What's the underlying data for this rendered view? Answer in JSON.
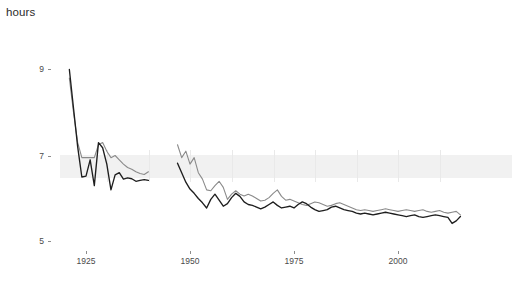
{
  "chart_data": {
    "type": "line",
    "title": "",
    "ylabel": "hours",
    "xlabel": "",
    "ylim": [
      4.55,
      9.55
    ],
    "xlim": [
      1918.5,
      2016.5
    ],
    "grid": "faint vertical gridlines at decade marks plus one faint horizontal band near 6.85",
    "legend": "none",
    "yticks": [
      9,
      7,
      5
    ],
    "ytick_labels": [
      "9",
      "7",
      "5"
    ],
    "xticks": [
      1925,
      1950,
      1975,
      2000
    ],
    "xtick_labels": [
      "1925",
      "1950",
      "1975",
      "2000"
    ],
    "series": [
      {
        "name": "dark-series",
        "color": "#1e1e1e",
        "x": [
          1921,
          1922,
          1923,
          1924,
          1925,
          1926,
          1927,
          1928,
          1929,
          1930,
          1931,
          1932,
          1933,
          1934,
          1935,
          1936,
          1937,
          1938,
          1939,
          1940,
          1947,
          1948,
          1949,
          1950,
          1951,
          1952,
          1953,
          1954,
          1955,
          1956,
          1957,
          1958,
          1959,
          1960,
          1961,
          1962,
          1963,
          1964,
          1965,
          1966,
          1967,
          1968,
          1969,
          1970,
          1971,
          1972,
          1973,
          1974,
          1975,
          1976,
          1977,
          1978,
          1979,
          1980,
          1981,
          1982,
          1983,
          1984,
          1985,
          1986,
          1987,
          1988,
          1989,
          1990,
          1991,
          1992,
          1993,
          1994,
          1995,
          1996,
          1997,
          1998,
          1999,
          2000,
          2001,
          2002,
          2003,
          2004,
          2005,
          2006,
          2007,
          2008,
          2009,
          2010,
          2011,
          2012,
          2013,
          2014,
          2015
        ],
        "values": [
          9.0,
          8.1,
          7.2,
          6.5,
          6.52,
          6.9,
          6.3,
          7.3,
          7.18,
          6.8,
          6.2,
          6.55,
          6.6,
          6.45,
          6.48,
          6.46,
          6.4,
          6.42,
          6.44,
          6.42,
          6.82,
          6.6,
          6.38,
          6.22,
          6.12,
          6.0,
          5.9,
          5.78,
          5.98,
          6.1,
          5.96,
          5.82,
          5.88,
          6.02,
          6.12,
          6.05,
          5.92,
          5.86,
          5.84,
          5.8,
          5.76,
          5.8,
          5.86,
          5.92,
          5.84,
          5.78,
          5.8,
          5.82,
          5.78,
          5.86,
          5.92,
          5.88,
          5.8,
          5.74,
          5.7,
          5.72,
          5.74,
          5.8,
          5.82,
          5.78,
          5.74,
          5.72,
          5.7,
          5.66,
          5.64,
          5.66,
          5.64,
          5.62,
          5.64,
          5.66,
          5.68,
          5.66,
          5.64,
          5.62,
          5.6,
          5.58,
          5.6,
          5.62,
          5.58,
          5.56,
          5.58,
          5.6,
          5.62,
          5.6,
          5.58,
          5.56,
          5.42,
          5.48,
          5.58
        ]
      },
      {
        "name": "gray-series",
        "color": "#8a8a8a",
        "x": [
          1921,
          1922,
          1923,
          1924,
          1925,
          1926,
          1927,
          1928,
          1929,
          1930,
          1931,
          1932,
          1933,
          1934,
          1935,
          1936,
          1937,
          1938,
          1939,
          1940,
          1947,
          1948,
          1949,
          1950,
          1951,
          1952,
          1953,
          1954,
          1955,
          1956,
          1957,
          1958,
          1959,
          1960,
          1961,
          1962,
          1963,
          1964,
          1965,
          1966,
          1967,
          1968,
          1969,
          1970,
          1971,
          1972,
          1973,
          1974,
          1975,
          1976,
          1977,
          1978,
          1979,
          1980,
          1981,
          1982,
          1983,
          1984,
          1985,
          1986,
          1987,
          1988,
          1989,
          1990,
          1991,
          1992,
          1993,
          1994,
          1995,
          1996,
          1997,
          1998,
          1999,
          2000,
          2001,
          2002,
          2003,
          2004,
          2005,
          2006,
          2007,
          2008,
          2009,
          2010,
          2011,
          2012,
          2013,
          2014,
          2015
        ],
        "values": [
          8.8,
          8.0,
          7.3,
          6.95,
          6.95,
          6.95,
          6.95,
          7.25,
          7.3,
          7.1,
          6.95,
          7.0,
          6.9,
          6.8,
          6.72,
          6.68,
          6.62,
          6.58,
          6.56,
          6.62,
          7.25,
          6.95,
          7.1,
          6.8,
          6.95,
          6.6,
          6.45,
          6.2,
          6.18,
          6.3,
          6.4,
          6.26,
          5.98,
          6.1,
          6.18,
          6.1,
          6.06,
          6.1,
          6.06,
          6.0,
          5.94,
          5.96,
          6.02,
          6.12,
          6.2,
          6.05,
          5.96,
          5.98,
          5.94,
          5.9,
          5.86,
          5.84,
          5.88,
          5.92,
          5.9,
          5.86,
          5.82,
          5.84,
          5.88,
          5.9,
          5.86,
          5.82,
          5.78,
          5.74,
          5.72,
          5.74,
          5.72,
          5.7,
          5.72,
          5.74,
          5.76,
          5.74,
          5.72,
          5.7,
          5.72,
          5.74,
          5.72,
          5.7,
          5.72,
          5.74,
          5.7,
          5.68,
          5.7,
          5.72,
          5.68,
          5.66,
          5.68,
          5.7,
          5.62
        ]
      }
    ]
  },
  "axis": {
    "y_title": "hours",
    "y_tick_0": "9",
    "y_tick_1": "7",
    "y_tick_2": "5",
    "x_tick_0": "1925",
    "x_tick_1": "1950",
    "x_tick_2": "1975",
    "x_tick_3": "2000"
  },
  "colors": {
    "dark_series": "#1e1e1e",
    "gray_series": "#8a8a8a",
    "tick": "#8d8d8d",
    "label": "#4a4a4a",
    "band": "#efefef",
    "gridline": "#e9e9e9"
  }
}
